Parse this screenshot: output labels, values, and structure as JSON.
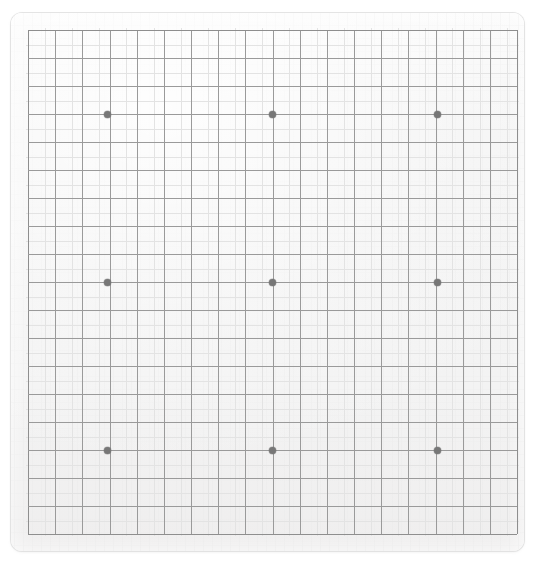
{
  "app": {
    "title": "Go Board",
    "surface_label": "goban",
    "canvas_width": 541,
    "canvas_height": 561,
    "background_color": "#ffffff"
  },
  "board": {
    "name": "go-board",
    "size_label": "19 x 19",
    "columns": 19,
    "rows": 19,
    "slab": {
      "left": 11,
      "top": 13,
      "width": 513,
      "height": 538,
      "corner_radius": 11,
      "fill_color": "#f3f3f3",
      "edge_color": "#dcdcdc"
    },
    "grid": {
      "left": 28,
      "top": 30,
      "width": 489,
      "height": 504,
      "cell_width": 27.17,
      "cell_height": 28.0,
      "line_color": "#9a9a9a",
      "edge_line_color": "#8e8e8e",
      "ghost_line_color": "#e3e3e3",
      "line_width": 1
    },
    "star_points": {
      "name": "hoshi",
      "color": "#777777",
      "diameter": 7,
      "count": 9,
      "column_indices": [
        3,
        9,
        15
      ],
      "row_indices": [
        3,
        9,
        15
      ],
      "coordinates": [
        {
          "label": "D16",
          "x": 107,
          "y": 114
        },
        {
          "label": "K16",
          "x": 272,
          "y": 114
        },
        {
          "label": "Q16",
          "x": 437,
          "y": 114
        },
        {
          "label": "D10",
          "x": 107,
          "y": 282
        },
        {
          "label": "K10",
          "x": 272,
          "y": 282
        },
        {
          "label": "Q10",
          "x": 437,
          "y": 282
        },
        {
          "label": "D4",
          "x": 107,
          "y": 450
        },
        {
          "label": "K4",
          "x": 272,
          "y": 450
        },
        {
          "label": "Q4",
          "x": 437,
          "y": 450
        }
      ]
    },
    "stones": [],
    "coordinate_labels_visible": false
  }
}
